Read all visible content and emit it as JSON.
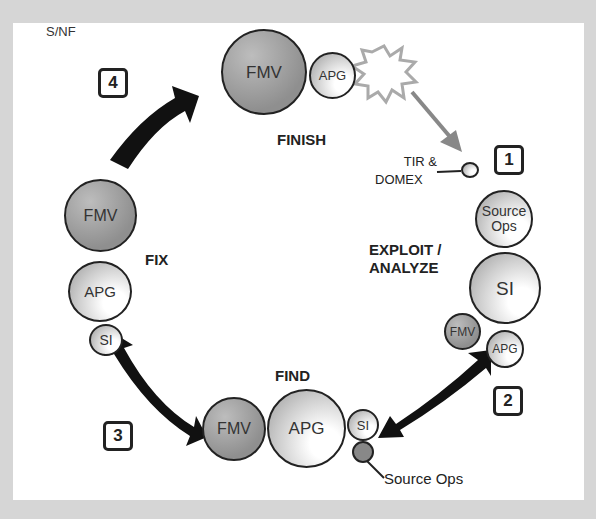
{
  "classification": "S/NF",
  "stages": {
    "finish": "FINISH",
    "exploit_analyze_line1": "EXPLOIT /",
    "exploit_analyze_line2": "ANALYZE",
    "find": "FIND",
    "fix": "FIX"
  },
  "step_numbers": [
    "1",
    "2",
    "3",
    "4"
  ],
  "nodes": {
    "finish": [
      {
        "label": "FMV",
        "size": "large",
        "shade": "dark"
      },
      {
        "label": "APG",
        "size": "small",
        "shade": "light"
      }
    ],
    "exploit": [
      {
        "label": "Source Ops",
        "size": "medium",
        "shade": "light"
      },
      {
        "label": "SI",
        "size": "large",
        "shade": "light"
      },
      {
        "label": "FMV",
        "size": "small",
        "shade": "dark"
      },
      {
        "label": "APG",
        "size": "small",
        "shade": "light"
      }
    ],
    "find": [
      {
        "label": "FMV",
        "size": "medium",
        "shade": "dark"
      },
      {
        "label": "APG",
        "size": "large",
        "shade": "light"
      },
      {
        "label": "SI",
        "size": "small",
        "shade": "light"
      },
      {
        "label": "",
        "size": "tiny",
        "shade": "dark"
      }
    ],
    "fix": [
      {
        "label": "FMV",
        "size": "medium",
        "shade": "dark"
      },
      {
        "label": "APG",
        "size": "medium",
        "shade": "light"
      },
      {
        "label": "SI",
        "size": "small",
        "shade": "light"
      }
    ]
  },
  "callouts": {
    "tir_domex_line1": "TIR &",
    "tir_domex_line2": "DOMEX",
    "source_ops": "Source Ops"
  }
}
